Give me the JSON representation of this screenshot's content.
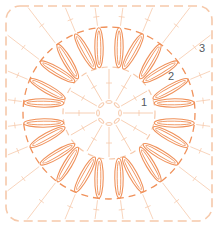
{
  "diagram": {
    "type": "crochet-chart",
    "shape": "granny-square",
    "center": [
      109,
      113
    ],
    "colors": {
      "primary": "#f0915a",
      "faint": "#f6c9ab",
      "label": "#555a60",
      "background": "#ffffff"
    },
    "rounds": [
      {
        "label": "1",
        "x": 141,
        "y": 97
      },
      {
        "label": "2",
        "x": 168,
        "y": 71
      },
      {
        "label": "3",
        "x": 199,
        "y": 43
      }
    ],
    "petal_groups": 12,
    "petals_per_group": 2
  }
}
